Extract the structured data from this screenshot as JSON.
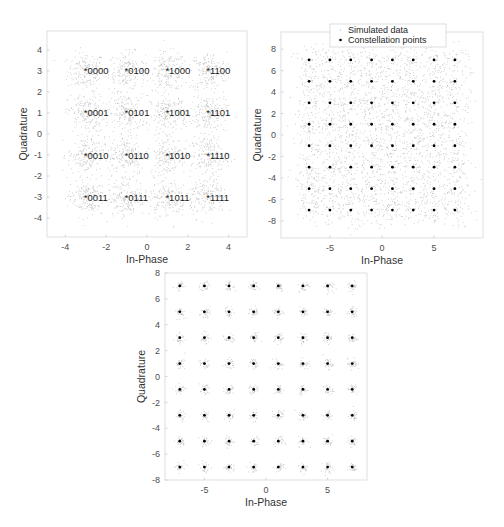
{
  "chart_data": [
    {
      "type": "scatter",
      "title": "",
      "subtitle": "16-QAM constellation with Gray-coded bit labels",
      "xlabel": "In-Phase",
      "ylabel": "Quadrature",
      "xlim": [
        -4.9,
        4.9
      ],
      "ylim": [
        -4.9,
        4.9
      ],
      "xticks": [
        -4,
        -2,
        0,
        2,
        4
      ],
      "yticks": [
        -4,
        -3,
        -2,
        -1,
        0,
        1,
        2,
        3,
        4
      ],
      "grid": false,
      "legend": null,
      "noise_sigma": 0.45,
      "points_per_symbol": 180,
      "series": [
        {
          "name": "Constellation points",
          "marker": "*",
          "points": [
            {
              "x": -3,
              "y": 3,
              "label": "0000"
            },
            {
              "x": -1,
              "y": 3,
              "label": "0100"
            },
            {
              "x": 1,
              "y": 3,
              "label": "1000"
            },
            {
              "x": 3,
              "y": 3,
              "label": "1100"
            },
            {
              "x": -3,
              "y": 1,
              "label": "0001"
            },
            {
              "x": -1,
              "y": 1,
              "label": "0101"
            },
            {
              "x": 1,
              "y": 1,
              "label": "1001"
            },
            {
              "x": 3,
              "y": 1,
              "label": "1101"
            },
            {
              "x": -3,
              "y": -1,
              "label": "0010"
            },
            {
              "x": -1,
              "y": -1,
              "label": "0110"
            },
            {
              "x": 1,
              "y": -1,
              "label": "1010"
            },
            {
              "x": 3,
              "y": -1,
              "label": "1110"
            },
            {
              "x": -3,
              "y": -3,
              "label": "0011"
            },
            {
              "x": -1,
              "y": -3,
              "label": "0111"
            },
            {
              "x": 1,
              "y": -3,
              "label": "1011"
            },
            {
              "x": 3,
              "y": -3,
              "label": "1111"
            }
          ]
        }
      ]
    },
    {
      "type": "scatter",
      "title": "",
      "subtitle": "64-QAM with heavy noise",
      "xlabel": "In-Phase",
      "ylabel": "Quadrature",
      "xlim": [
        -9.7,
        9.7
      ],
      "ylim": [
        -9.6,
        9.6
      ],
      "xticks": [
        -5,
        0,
        5
      ],
      "yticks": [
        -8,
        -6,
        -4,
        -2,
        0,
        2,
        4,
        6,
        8
      ],
      "grid": false,
      "legend": {
        "position": "north",
        "entries": [
          "Simulated data",
          "Constellation points"
        ]
      },
      "noise_sigma": 0.75,
      "points_per_symbol": 45,
      "levels": [
        -7,
        -5,
        -3,
        -1,
        1,
        3,
        5,
        7
      ],
      "series": [
        {
          "name": "Simulated data",
          "marker": ".",
          "color": "#b0b0b0"
        },
        {
          "name": "Constellation points",
          "marker": "*",
          "color": "#000000"
        }
      ]
    },
    {
      "type": "scatter",
      "title": "",
      "subtitle": "64-QAM with low noise",
      "xlabel": "In-Phase",
      "ylabel": "Quadrature",
      "xlim": [
        -8.2,
        8.2
      ],
      "ylim": [
        -8,
        8
      ],
      "xticks": [
        -5,
        0,
        5
      ],
      "yticks": [
        -8,
        -6,
        -4,
        -2,
        0,
        2,
        4,
        6,
        8
      ],
      "grid": false,
      "legend": null,
      "noise_sigma": 0.2,
      "points_per_symbol": 30,
      "levels": [
        -7,
        -5,
        -3,
        -1,
        1,
        3,
        5,
        7
      ],
      "series": [
        {
          "name": "Simulated data",
          "marker": ".",
          "color": "#b0b0b0"
        },
        {
          "name": "Constellation points",
          "marker": "*",
          "color": "#000000"
        }
      ]
    }
  ],
  "figures": [
    {
      "name": "qam16-plot",
      "box": {
        "left": 47,
        "top": 31,
        "right": 247,
        "bottom": 237
      }
    },
    {
      "name": "qam64-noisy-plot",
      "box": {
        "left": 281,
        "top": 32,
        "right": 483,
        "bottom": 238
      }
    },
    {
      "name": "qam64-clean-plot",
      "box": {
        "left": 165,
        "top": 273,
        "right": 367,
        "bottom": 480
      }
    }
  ],
  "colors": {
    "noise": "#b4b4b4",
    "marker": "#000000",
    "axis": "#d6d6d6",
    "tick_text": "#4d4d4d"
  }
}
